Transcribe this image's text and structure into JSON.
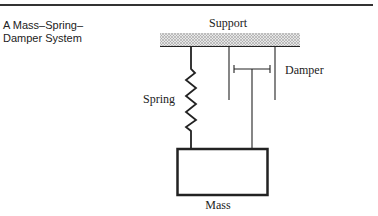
{
  "title": {
    "line1": "A Mass–Spring–",
    "line2": "Damper System"
  },
  "diagram": {
    "labels": {
      "support": "Support",
      "spring": "Spring",
      "damper": "Damper",
      "mass": "Mass"
    },
    "colors": {
      "line": "#222222",
      "hatch": "#999999"
    }
  }
}
